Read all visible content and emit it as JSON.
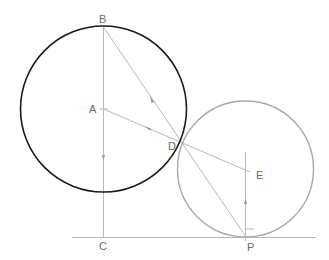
{
  "diagram": {
    "title": "",
    "points": {
      "A": "A",
      "B": "B",
      "C": "C",
      "D": "D",
      "E": "E",
      "P": "P"
    },
    "elements": [
      "circle centered at A through B (tangent point D)",
      "circle centered at E tangent to ground line at P and tangent to first circle at D",
      "segment B-C vertical diameter line",
      "segment B-P through D",
      "segment A-D-E",
      "segment E-P vertical",
      "ground line through C and P"
    ],
    "colors": {
      "primary_circle": "#1a1a1a",
      "secondary_circle": "#a8a8a8",
      "construction_line": "#b8b8b8",
      "label": "#6b6b6b"
    }
  }
}
